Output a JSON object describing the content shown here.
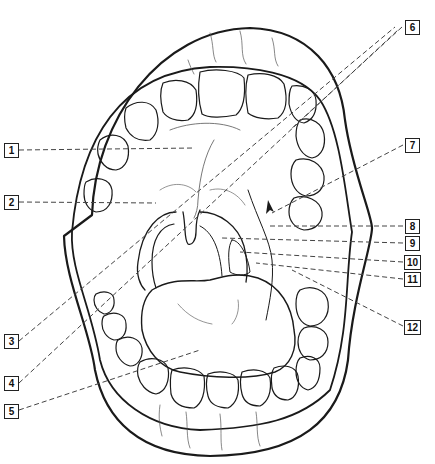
{
  "diagram": {
    "stroke_color": "#1a1a1a",
    "leader_color": "#444444",
    "background": "#ffffff",
    "labels": [
      {
        "id": "1",
        "x": 4,
        "y": 143,
        "target": [
          195,
          148
        ]
      },
      {
        "id": "2",
        "x": 4,
        "y": 195,
        "target": [
          155,
          203
        ]
      },
      {
        "id": "3",
        "x": 4,
        "y": 336,
        "target": [
          300,
          40
        ]
      },
      {
        "id": "4",
        "x": 4,
        "y": 378,
        "target": [
          302,
          45
        ]
      },
      {
        "id": "5",
        "x": 4,
        "y": 405,
        "target": [
          200,
          350
        ]
      },
      {
        "id": "6",
        "x": 405,
        "y": 21,
        "target": [
          300,
          130
        ]
      },
      {
        "id": "7",
        "x": 405,
        "y": 138,
        "target": [
          280,
          213
        ]
      },
      {
        "id": "8",
        "x": 405,
        "y": 219,
        "target": [
          270,
          225
        ]
      },
      {
        "id": "9",
        "x": 405,
        "y": 236,
        "target": [
          222,
          238
        ]
      },
      {
        "id": "10",
        "x": 405,
        "y": 256,
        "target": [
          240,
          252
        ]
      },
      {
        "id": "11",
        "x": 405,
        "y": 273,
        "target": [
          255,
          262
        ]
      },
      {
        "id": "12",
        "x": 405,
        "y": 321,
        "target": [
          290,
          270
        ]
      }
    ]
  }
}
